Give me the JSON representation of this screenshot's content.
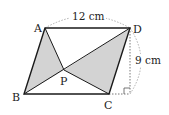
{
  "diagram": {
    "type": "geometry",
    "shape": "parallelogram",
    "points": {
      "A": {
        "label": "A",
        "x": 45,
        "y": 28
      },
      "B": {
        "label": "B",
        "x": 24,
        "y": 94
      },
      "C": {
        "label": "C",
        "x": 109,
        "y": 94
      },
      "D": {
        "label": "D",
        "x": 130,
        "y": 28
      },
      "P": {
        "label": "P",
        "x": 64,
        "y": 70
      }
    },
    "dimensions": {
      "top_length": "12 cm",
      "height": "9 cm"
    },
    "shaded_regions": [
      "triangle ABP",
      "triangle PCD"
    ],
    "colors": {
      "line": "#1a1a1a",
      "shade": "#d3d3d3",
      "dotted": "#9a9a9a"
    }
  }
}
